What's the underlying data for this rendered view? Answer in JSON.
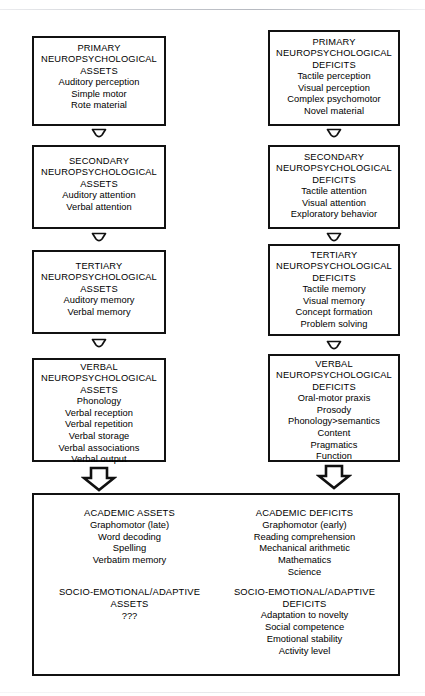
{
  "diagram": {
    "columns": [
      "assets",
      "deficits"
    ],
    "levels": [
      {
        "level": "primary",
        "assets": {
          "title": [
            "PRIMARY",
            "NEUROPSYCHOLOGICAL",
            "ASSETS"
          ],
          "items": [
            "Auditory perception",
            "Simple motor",
            "Rote material"
          ]
        },
        "deficits": {
          "title": [
            "PRIMARY",
            "NEUROPSYCHOLOGICAL",
            "DEFICITS"
          ],
          "items": [
            "Tactile perception",
            "Visual perception",
            "Complex psychomotor",
            "Novel material"
          ]
        }
      },
      {
        "level": "secondary",
        "assets": {
          "title": [
            "SECONDARY",
            "NEUROPSYCHOLOGICAL",
            "ASSETS"
          ],
          "items": [
            "Auditory attention",
            "Verbal attention"
          ]
        },
        "deficits": {
          "title": [
            "SECONDARY",
            "NEUROPSYCHOLOGICAL",
            "DEFICITS"
          ],
          "items": [
            "Tactile attention",
            "Visual attention",
            "Exploratory behavior"
          ]
        }
      },
      {
        "level": "tertiary",
        "assets": {
          "title": [
            "TERTIARY",
            "NEUROPSYCHOLOGICAL",
            "ASSETS"
          ],
          "items": [
            "Auditory memory",
            "Verbal memory"
          ]
        },
        "deficits": {
          "title": [
            "TERTIARY",
            "NEUROPSYCHOLOGICAL",
            "DEFICITS"
          ],
          "items": [
            "Tactile memory",
            "Visual memory",
            "Concept formation",
            "Problem solving"
          ]
        }
      },
      {
        "level": "verbal",
        "assets": {
          "title": [
            "VERBAL",
            "NEUROPSYCHOLOGICAL",
            "ASSETS"
          ],
          "items": [
            "Phonology",
            "Verbal reception",
            "Verbal repetition",
            "Verbal storage",
            "Verbal associations",
            "Verbal output"
          ]
        },
        "deficits": {
          "title": [
            "VERBAL",
            "NEUROPSYCHOLOGICAL",
            "DEFICITS"
          ],
          "items": [
            "Oral-motor praxis",
            "Prosody",
            "Phonology>semantics",
            "Content",
            "Pragmatics",
            "Function"
          ]
        }
      }
    ],
    "outcome_panel": {
      "assets": {
        "academic": {
          "title": "ACADEMIC ASSETS",
          "items": [
            "Graphomotor (late)",
            "Word decoding",
            "Spelling",
            "Verbatim memory"
          ]
        },
        "socio_emotional": {
          "title": [
            "SOCIO-EMOTIONAL/ADAPTIVE",
            "ASSETS"
          ],
          "items": [
            "???"
          ]
        }
      },
      "deficits": {
        "academic": {
          "title": "ACADEMIC DEFICITS",
          "items": [
            "Graphomotor (early)",
            "Reading comprehension",
            "Mechanical arithmetic",
            "Mathematics",
            "Science"
          ]
        },
        "socio_emotional": {
          "title": [
            "SOCIO-EMOTIONAL/ADAPTIVE",
            "DEFICITS"
          ],
          "items": [
            "Adaptation to novelty",
            "Social competence",
            "Emotional stability",
            "Activity level"
          ]
        }
      }
    },
    "connectors": {
      "small_arrow_name": "down-arrow-icon",
      "large_arrow_name": "large-down-arrow-icon",
      "count_small": 6,
      "count_large": 2
    },
    "colors": {
      "stroke": "#111111",
      "background": "#ffffff",
      "text": "#000000"
    }
  }
}
